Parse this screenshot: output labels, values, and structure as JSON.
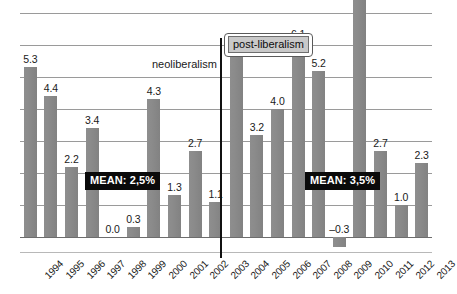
{
  "chart_data": {
    "type": "bar",
    "title": "",
    "subtitle": "",
    "xlabel": "",
    "ylabel": "",
    "grid": true,
    "legend": "none",
    "ylim": [
      -1.0,
      8.0
    ],
    "gridline_step": 1.0,
    "categories": [
      "1994",
      "1995",
      "1996",
      "1997",
      "1998",
      "1999",
      "2000",
      "2001",
      "2002",
      "2003",
      "2004",
      "2005",
      "2006",
      "2007",
      "2008",
      "2009",
      "2010",
      "2011",
      "2012",
      "2013"
    ],
    "values": [
      5.3,
      4.4,
      2.2,
      3.4,
      0.0,
      0.3,
      4.3,
      1.3,
      2.7,
      1.1,
      5.7,
      3.2,
      4.0,
      6.1,
      5.2,
      -0.3,
      7.5,
      2.7,
      1.0,
      2.3
    ],
    "value_labels": [
      "5.3",
      "4.4",
      "2.2",
      "3.4",
      "0.0",
      "0.3",
      "4.3",
      "1.3",
      "2.7",
      "1.1",
      "5.7",
      "3.2",
      "4.0",
      "6.1",
      "5.2",
      "–0.3",
      "7.5",
      "2.7",
      "1.0",
      "2.3"
    ],
    "bar_color": "#8b8b8b",
    "annotations": [
      {
        "id": "neoliberalism",
        "text": "neoliberalism",
        "style": "plain"
      },
      {
        "id": "post-liberalism",
        "text": "post-liberalism",
        "style": "boxed"
      },
      {
        "id": "mean-left",
        "text": "MEAN: 2,5%",
        "style": "badge"
      },
      {
        "id": "mean-right",
        "text": "MEAN: 3,5%",
        "style": "badge"
      }
    ],
    "divider": {
      "between": [
        "2003",
        "2004"
      ],
      "label_left": "neoliberalism",
      "label_right": "post-liberalism"
    },
    "period_means": [
      {
        "period": "neoliberalism",
        "years": "1994-2003",
        "mean": 2.5,
        "label": "MEAN: 2,5%"
      },
      {
        "period": "post-liberalism",
        "years": "2004-2013",
        "mean": 3.5,
        "label": "MEAN: 3,5%"
      }
    ]
  }
}
